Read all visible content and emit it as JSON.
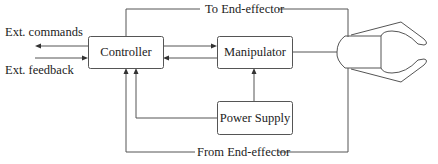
{
  "diagram": {
    "colors": {
      "line": "#555555",
      "text": "#222222",
      "background": "#ffffff"
    },
    "blocks": {
      "controller": {
        "label": "Controller"
      },
      "manipulator": {
        "label": "Manipulator"
      },
      "power_supply": {
        "label": "Power Supply"
      },
      "end_effector": {
        "label": "End-effector (gripper)"
      }
    },
    "signals": {
      "ext_commands": "Ext. commands",
      "ext_feedback": "Ext. feedback",
      "to_end_effector": "To End-effector",
      "from_end_effector": "From End-effector"
    },
    "connections": [
      {
        "from": "controller",
        "to": "external",
        "label": "Ext. commands"
      },
      {
        "from": "external",
        "to": "controller",
        "label": "Ext. feedback"
      },
      {
        "from": "controller",
        "to": "manipulator"
      },
      {
        "from": "manipulator",
        "to": "controller"
      },
      {
        "from": "power_supply",
        "to": "manipulator"
      },
      {
        "from": "power_supply",
        "to": "controller"
      },
      {
        "from": "controller",
        "to": "end_effector",
        "label": "To End-effector"
      },
      {
        "from": "end_effector",
        "to": "controller",
        "label": "From End-effector"
      },
      {
        "from": "manipulator",
        "to": "end_effector"
      }
    ]
  }
}
